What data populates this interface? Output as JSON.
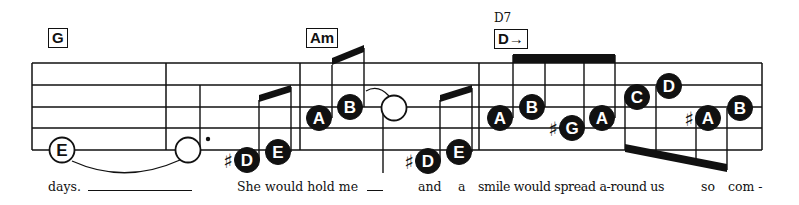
{
  "sheet": {
    "title": "Easy-read lead sheet excerpt",
    "chords": [
      {
        "id": "g",
        "label": "G",
        "x": 48,
        "y": 28
      },
      {
        "id": "am",
        "label": "Am",
        "x": 306,
        "y": 28
      },
      {
        "id": "d",
        "label": "D→",
        "x": 494,
        "y": 29,
        "above": "D7"
      }
    ],
    "lyrics": [
      {
        "text": "days.",
        "x": 48
      },
      {
        "text": "She would hold me",
        "x": 237
      },
      {
        "text": "and",
        "x": 418
      },
      {
        "text": "a",
        "x": 458
      },
      {
        "text": "smile would spread a-round us",
        "x": 478
      },
      {
        "text": "so",
        "x": 701
      },
      {
        "text": "com -",
        "x": 728
      }
    ],
    "notes": [
      {
        "name": "E",
        "x": 62,
        "y": 150,
        "style": "open",
        "accidental": ""
      },
      {
        "name": "",
        "x": 188,
        "y": 150,
        "style": "half",
        "accidental": ""
      },
      {
        "name": "D",
        "x": 247,
        "y": 160,
        "style": "filled",
        "accidental": "#"
      },
      {
        "name": "E",
        "x": 278,
        "y": 152,
        "style": "filled",
        "accidental": ""
      },
      {
        "name": "A",
        "x": 319,
        "y": 118,
        "style": "filled",
        "accidental": ""
      },
      {
        "name": "B",
        "x": 350,
        "y": 107,
        "style": "filled",
        "accidental": ""
      },
      {
        "name": "",
        "x": 394,
        "y": 108,
        "style": "half",
        "accidental": ""
      },
      {
        "name": "D",
        "x": 428,
        "y": 161,
        "style": "filled",
        "accidental": "#"
      },
      {
        "name": "E",
        "x": 459,
        "y": 152,
        "style": "filled",
        "accidental": ""
      },
      {
        "name": "A",
        "x": 500,
        "y": 118,
        "style": "filled",
        "accidental": ""
      },
      {
        "name": "B",
        "x": 532,
        "y": 107,
        "style": "filled",
        "accidental": ""
      },
      {
        "name": "G",
        "x": 572,
        "y": 128,
        "style": "filled",
        "accidental": "#"
      },
      {
        "name": "A",
        "x": 602,
        "y": 118,
        "style": "filled",
        "accidental": ""
      },
      {
        "name": "C",
        "x": 637,
        "y": 97,
        "style": "filled",
        "accidental": ""
      },
      {
        "name": "D",
        "x": 669,
        "y": 86,
        "style": "filled",
        "accidental": ""
      },
      {
        "name": "A",
        "x": 708,
        "y": 118,
        "style": "filled",
        "accidental": "#"
      },
      {
        "name": "B",
        "x": 740,
        "y": 108,
        "style": "filled",
        "accidental": ""
      }
    ]
  }
}
